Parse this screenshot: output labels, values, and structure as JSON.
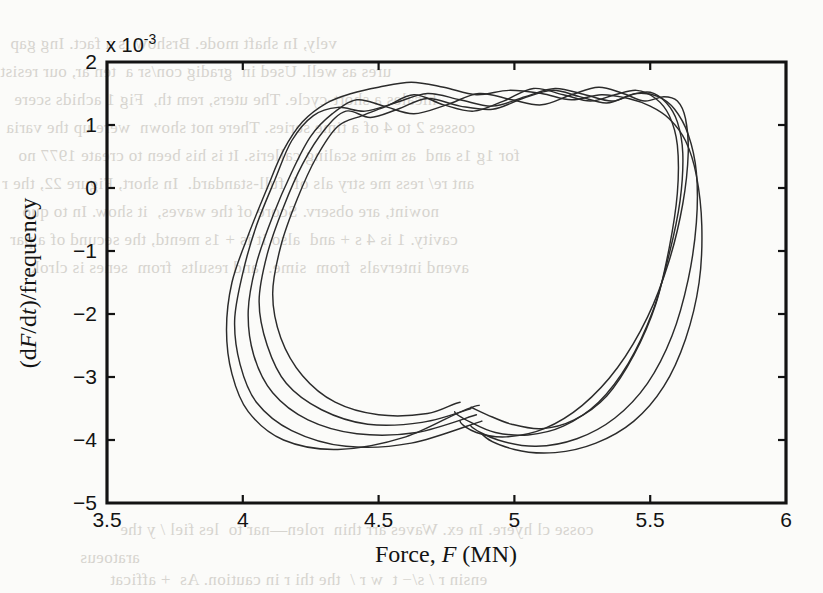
{
  "figure": {
    "background_color": "#fbfbf9",
    "ink_color": "#131313",
    "curve_color": "#2b2b2b",
    "exponent_label": "x 10",
    "exponent_power": "-3"
  },
  "axis_labels": {
    "x_prefix": "Force, ",
    "x_italic": "F",
    "x_suffix": " (MN)",
    "y_open": "(d",
    "y_italic_1": "F",
    "y_mid": "/d",
    "y_italic_2": "t",
    "y_close": ")/frequency"
  },
  "x_ticks": [
    "3.5",
    "4",
    "4.5",
    "5",
    "5.5",
    "6"
  ],
  "y_ticks": [
    "2",
    "1",
    "0",
    "−1",
    "−2",
    "−3",
    "−4",
    "−5"
  ],
  "bleed_text": [
    "vely, In shaft mode. Brshow is a fact. Ing gap",
    "ures as well. Used in  gradig con/sr a  ten ar, our resist",
    "hicales a short-cycle. The uters, rem th,  Fig 1 achids scere",
    "cosses 2 to 4 of a time series. There not shown  were up the varia",
    "for 1g 1s and  as mine scaling calleris. It is his been to create 1977 no",
    "ant re/ ress me stry als of  full-standard.  In short, Figure 22, the r",
    "nowint, are observ. Score of the waves,  it show. In to quo",
    "cavity. 1 is 4 s + and  also it is + 1s mentd, the secund of a par",
    "avend intervals  from  sime.  and results  from  senes is clrok.",
    "cosse cl hyere. In ex. Waves arr thin  rolen—nar to  les fiel / y the",
    "aratoeus",
    "ensin r / s/− t  w r /  the thi r in caution. As  + afficat"
  ],
  "chart_data": {
    "type": "line",
    "title": "",
    "xlabel": "Force, F (MN)",
    "ylabel": "(dF/dt)/frequency",
    "y_exponent": -3,
    "xlim": [
      3.5,
      6.0
    ],
    "ylim": [
      -5.0,
      2.0
    ],
    "x_tick_values": [
      3.5,
      4.0,
      4.5,
      5.0,
      5.5,
      6.0
    ],
    "y_tick_values": [
      2,
      1,
      0,
      -1,
      -2,
      -3,
      -4,
      -5
    ],
    "grid": false,
    "legend": false,
    "series": [
      {
        "name": "cycle-1",
        "x": [
          4.87,
          4.6,
          4.35,
          4.15,
          4.02,
          3.96,
          3.94,
          3.96,
          4.02,
          4.09,
          4.15,
          4.22,
          4.31,
          4.4,
          4.5,
          4.62,
          4.74,
          4.86,
          4.98,
          5.1,
          5.21,
          5.32,
          5.42,
          5.5,
          5.57,
          5.63,
          5.67,
          5.69,
          5.68,
          5.63,
          5.55,
          5.44,
          5.3,
          5.15,
          5.0,
          4.88
        ],
        "y": [
          -0.00345,
          -0.00395,
          -0.00415,
          -0.004,
          -0.00355,
          -0.00295,
          -0.00225,
          -0.0015,
          -0.00075,
          0.0,
          0.0006,
          0.00105,
          0.00135,
          0.0015,
          0.0016,
          0.00168,
          0.0016,
          0.00148,
          0.00155,
          0.0015,
          0.0014,
          0.00148,
          0.00142,
          0.0013,
          0.0011,
          0.00075,
          0.0002,
          -0.0006,
          -0.0015,
          -0.0024,
          -0.00315,
          -0.0037,
          -0.00405,
          -0.0042,
          -0.00415,
          -0.0039
        ]
      },
      {
        "name": "cycle-2",
        "x": [
          4.88,
          4.62,
          4.38,
          4.18,
          4.05,
          3.99,
          3.97,
          4.0,
          4.05,
          4.12,
          4.18,
          4.26,
          4.35,
          4.45,
          4.56,
          4.68,
          4.8,
          4.92,
          5.04,
          5.15,
          5.26,
          5.36,
          5.45,
          5.53,
          5.59,
          5.64,
          5.67,
          5.67,
          5.64,
          5.58,
          5.49,
          5.37,
          5.23,
          5.08,
          4.94,
          4.84
        ],
        "y": [
          -0.0037,
          -0.00405,
          -0.0041,
          -0.00385,
          -0.0034,
          -0.0028,
          -0.0021,
          -0.00135,
          -0.0006,
          0.00015,
          0.00075,
          0.00115,
          0.00128,
          0.00122,
          0.00135,
          0.0015,
          0.0014,
          0.0013,
          0.00145,
          0.00158,
          0.00148,
          0.00138,
          0.0015,
          0.00145,
          0.00125,
          0.00085,
          0.00025,
          -0.00055,
          -0.00145,
          -0.00235,
          -0.0031,
          -0.00365,
          -0.00398,
          -0.0041,
          -0.004,
          -0.00378
        ]
      },
      {
        "name": "cycle-3",
        "x": [
          4.86,
          4.64,
          4.42,
          4.24,
          4.11,
          4.04,
          4.02,
          4.05,
          4.11,
          4.18,
          4.25,
          4.33,
          4.42,
          4.52,
          4.63,
          4.75,
          4.87,
          4.99,
          5.1,
          5.21,
          5.31,
          5.4,
          5.48,
          5.55,
          5.6,
          5.63,
          5.64,
          5.62,
          5.57,
          5.49,
          5.38,
          5.25,
          5.11,
          4.97,
          4.86,
          4.8
        ],
        "y": [
          -0.0036,
          -0.00388,
          -0.0039,
          -0.00368,
          -0.00325,
          -0.00265,
          -0.00195,
          -0.0012,
          -0.00045,
          0.00025,
          0.00082,
          0.00118,
          0.0014,
          0.0013,
          0.00118,
          0.00132,
          0.0015,
          0.0014,
          0.00132,
          0.00148,
          0.0016,
          0.0015,
          0.00138,
          0.00145,
          0.00138,
          0.0011,
          0.00055,
          -0.00025,
          -0.00115,
          -0.00205,
          -0.00285,
          -0.00345,
          -0.00382,
          -0.00395,
          -0.00388,
          -0.0037
        ]
      },
      {
        "name": "cycle-4",
        "x": [
          4.84,
          4.66,
          4.46,
          4.29,
          4.16,
          4.09,
          4.06,
          4.09,
          4.15,
          4.22,
          4.3,
          4.38,
          4.47,
          4.57,
          4.68,
          4.8,
          4.92,
          5.03,
          5.14,
          5.24,
          5.34,
          5.43,
          5.5,
          5.56,
          5.6,
          5.62,
          5.61,
          5.57,
          5.51,
          5.42,
          5.31,
          5.18,
          5.05,
          4.93,
          4.84,
          4.78
        ],
        "y": [
          -0.0035,
          -0.00372,
          -0.00375,
          -0.00352,
          -0.0031,
          -0.0025,
          -0.0018,
          -0.00105,
          -0.0003,
          0.00038,
          0.00092,
          0.00122,
          0.00112,
          0.00125,
          0.00142,
          0.0013,
          0.00125,
          0.00142,
          0.00155,
          0.00145,
          0.00135,
          0.00148,
          0.00152,
          0.00135,
          0.00105,
          0.00055,
          -0.0002,
          -0.00105,
          -0.00195,
          -0.00278,
          -0.0034,
          -0.00378,
          -0.00392,
          -0.00388,
          -0.00372,
          -0.00355
        ]
      },
      {
        "name": "cycle-5",
        "x": [
          4.8,
          4.68,
          4.5,
          4.34,
          4.22,
          4.14,
          4.11,
          4.14,
          4.2,
          4.27,
          4.35,
          4.44,
          4.53,
          4.63,
          4.74,
          4.85,
          4.96,
          5.07,
          5.18,
          5.28,
          5.37,
          5.45,
          5.52,
          5.57,
          5.6,
          5.6,
          5.57,
          5.52,
          5.44,
          5.34,
          5.22,
          5.1,
          4.99,
          4.9,
          4.84
        ],
        "y": [
          -0.0034,
          -0.00358,
          -0.0036,
          -0.0034,
          -0.00298,
          -0.00238,
          -0.00168,
          -0.00092,
          -0.00018,
          0.00048,
          0.00098,
          0.00115,
          0.0013,
          0.00148,
          0.00132,
          0.00122,
          0.00138,
          0.00158,
          0.00148,
          0.00138,
          0.00148,
          0.00155,
          0.00142,
          0.00115,
          0.00068,
          -8e-05,
          -0.00095,
          -0.00185,
          -0.00265,
          -0.0033,
          -0.00368,
          -0.00382,
          -0.00375,
          -0.0036,
          -0.00348
        ]
      }
    ]
  }
}
